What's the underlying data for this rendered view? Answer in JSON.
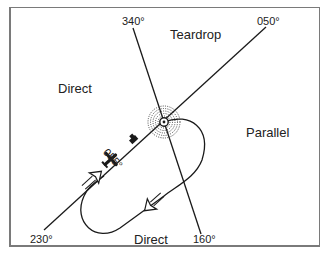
{
  "diagram": {
    "type": "holding-pattern-entry-procedures",
    "radials": [
      {
        "id": "r340",
        "label": "340°"
      },
      {
        "id": "r050",
        "label": "050°"
      },
      {
        "id": "r230",
        "label": "230°"
      },
      {
        "id": "r160",
        "label": "160°"
      }
    ],
    "sectors": {
      "teardrop": "Teardrop",
      "direct_left": "Direct",
      "parallel": "Parallel",
      "direct_bottom": "Direct"
    },
    "aircraft_heading_label": "055°",
    "colors": {
      "line": "#1a1a1a",
      "frame": "#7a7a7a",
      "background": "#ffffff"
    }
  }
}
